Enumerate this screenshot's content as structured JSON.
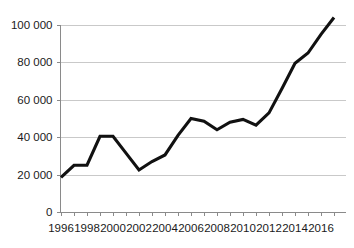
{
  "chart_data": {
    "type": "line",
    "title": "",
    "subtitle": "",
    "xlabel": "",
    "ylabel": "",
    "grid": "horizontal",
    "legend": "none",
    "xlim": [
      1996,
      2017
    ],
    "ylim": [
      0,
      110000
    ],
    "x": [
      1996,
      1997,
      1998,
      1999,
      2000,
      2001,
      2002,
      2003,
      2004,
      2005,
      2006,
      2007,
      2008,
      2009,
      2010,
      2011,
      2012,
      2013,
      2014,
      2015,
      2016,
      2017
    ],
    "series": [
      {
        "name": "value",
        "color": "#111111",
        "values": [
          18500,
          25000,
          25000,
          40500,
          40500,
          31500,
          22500,
          27000,
          30500,
          41000,
          50000,
          48500,
          44000,
          48000,
          49500,
          46500,
          53000,
          66000,
          79500,
          85000,
          95000,
          104000
        ]
      }
    ],
    "y_ticks": [
      0,
      20000,
      40000,
      60000,
      80000,
      100000
    ],
    "y_tick_labels": [
      "0",
      "20 000",
      "40 000",
      "60 000",
      "80 000",
      "100 000"
    ],
    "x_ticks": [
      1996,
      1997,
      1998,
      1999,
      2000,
      2001,
      2002,
      2003,
      2004,
      2005,
      2006,
      2007,
      2008,
      2009,
      2010,
      2011,
      2012,
      2013,
      2014,
      2015,
      2016,
      2017
    ],
    "x_tick_labels_shown": [
      "1996",
      "1998",
      "2000",
      "2002",
      "2004",
      "2006",
      "2008",
      "2010",
      "2012",
      "2014",
      "2016"
    ],
    "colors": {
      "line": "#111111",
      "grid": "#c9c9c9",
      "axis": "#8a8a8a",
      "text": "#1a1a1a",
      "background": "#ffffff"
    }
  }
}
